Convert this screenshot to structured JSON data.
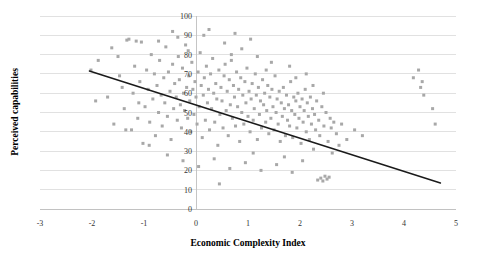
{
  "chart_data": {
    "type": "scatter",
    "title": "",
    "xlabel": "Economic Complexity Index",
    "ylabel": "Perceived capabilities",
    "xlim": [
      -3,
      5
    ],
    "ylim": [
      0,
      100
    ],
    "xticks": [
      "-3",
      "-2",
      "-1",
      "0",
      "1",
      "2",
      "3",
      "4",
      "5"
    ],
    "xtick_values": [
      -3,
      -2,
      -1,
      0,
      1,
      2,
      3,
      4,
      5
    ],
    "yticks": [
      "0",
      "10",
      "20",
      "30",
      "40",
      "50",
      "60",
      "70",
      "80",
      "90",
      "100"
    ],
    "ytick_values": [
      0,
      10,
      20,
      30,
      40,
      50,
      60,
      70,
      80,
      90,
      100
    ],
    "grid": "horizontal",
    "legend": "none",
    "marker": "square",
    "marker_color": "#a8a8a8",
    "marker_size_px": 3,
    "trendline": {
      "type": "linear",
      "color": "#1a1a1a",
      "x_start": -2.05,
      "y_start": 71.5,
      "x_end": 4.7,
      "y_end": 13.5
    },
    "points": [
      [
        -2.02,
        72.0
      ],
      [
        -1.93,
        56.0
      ],
      [
        -1.62,
        83.5
      ],
      [
        -1.58,
        44.0
      ],
      [
        -1.47,
        69.0
      ],
      [
        -1.42,
        63.0
      ],
      [
        -1.38,
        52.0
      ],
      [
        -1.33,
        87.5
      ],
      [
        -1.29,
        88.0
      ],
      [
        -1.24,
        41.0
      ],
      [
        -1.21,
        60.0
      ],
      [
        -1.18,
        74.0
      ],
      [
        -1.15,
        87.0
      ],
      [
        -1.12,
        47.0
      ],
      [
        -1.08,
        66.0
      ],
      [
        -1.05,
        86.5
      ],
      [
        -1.02,
        34.0
      ],
      [
        -0.98,
        53.0
      ],
      [
        -0.95,
        72.0
      ],
      [
        -0.92,
        62.0
      ],
      [
        -0.89,
        45.0
      ],
      [
        -0.86,
        80.0
      ],
      [
        -0.83,
        57.0
      ],
      [
        -0.8,
        70.0
      ],
      [
        -0.78,
        38.0
      ],
      [
        -0.75,
        64.0
      ],
      [
        -0.72,
        50.0
      ],
      [
        -0.7,
        77.0
      ],
      [
        -0.67,
        59.0
      ],
      [
        -0.65,
        43.0
      ],
      [
        -0.62,
        68.0
      ],
      [
        -0.6,
        55.0
      ],
      [
        -0.58,
        84.0
      ],
      [
        -0.55,
        48.0
      ],
      [
        -0.53,
        71.0
      ],
      [
        -0.5,
        61.0
      ],
      [
        -0.48,
        36.0
      ],
      [
        -0.45,
        75.0
      ],
      [
        -0.43,
        52.0
      ],
      [
        -0.41,
        65.0
      ],
      [
        -0.38,
        58.0
      ],
      [
        -0.36,
        46.0
      ],
      [
        -0.34,
        79.0
      ],
      [
        -0.32,
        67.0
      ],
      [
        -0.3,
        54.0
      ],
      [
        -0.28,
        42.0
      ],
      [
        -0.26,
        73.0
      ],
      [
        -0.24,
        60.0
      ],
      [
        -0.22,
        51.0
      ],
      [
        -0.2,
        85.0
      ],
      [
        -0.18,
        63.0
      ],
      [
        -0.16,
        47.0
      ],
      [
        -0.14,
        69.0
      ],
      [
        -0.12,
        56.0
      ],
      [
        -0.1,
        40.0
      ],
      [
        -0.08,
        76.0
      ],
      [
        -0.06,
        62.0
      ],
      [
        -0.04,
        49.0
      ],
      [
        -0.02,
        66.0
      ],
      [
        0.0,
        58.0
      ],
      [
        0.02,
        44.0
      ],
      [
        0.04,
        71.0
      ],
      [
        0.06,
        53.0
      ],
      [
        0.08,
        81.0
      ],
      [
        0.1,
        64.0
      ],
      [
        0.12,
        37.0
      ],
      [
        0.14,
        59.0
      ],
      [
        0.16,
        68.0
      ],
      [
        0.18,
        46.0
      ],
      [
        0.2,
        74.0
      ],
      [
        0.22,
        55.0
      ],
      [
        0.24,
        62.0
      ],
      [
        0.26,
        41.0
      ],
      [
        0.28,
        70.0
      ],
      [
        0.3,
        52.0
      ],
      [
        0.32,
        78.0
      ],
      [
        0.34,
        60.0
      ],
      [
        0.36,
        45.0
      ],
      [
        0.38,
        65.0
      ],
      [
        0.4,
        57.0
      ],
      [
        0.42,
        33.0
      ],
      [
        0.44,
        72.0
      ],
      [
        0.46,
        49.0
      ],
      [
        0.48,
        63.0
      ],
      [
        0.5,
        56.0
      ],
      [
        0.52,
        42.0
      ],
      [
        0.54,
        69.0
      ],
      [
        0.56,
        75.0
      ],
      [
        0.58,
        51.0
      ],
      [
        0.6,
        61.0
      ],
      [
        0.62,
        38.0
      ],
      [
        0.64,
        67.0
      ],
      [
        0.66,
        54.0
      ],
      [
        0.68,
        80.0
      ],
      [
        0.7,
        47.0
      ],
      [
        0.72,
        64.0
      ],
      [
        0.74,
        58.0
      ],
      [
        0.76,
        43.0
      ],
      [
        0.78,
        71.0
      ],
      [
        0.8,
        53.0
      ],
      [
        0.82,
        62.0
      ],
      [
        0.84,
        35.0
      ],
      [
        0.86,
        68.0
      ],
      [
        0.88,
        50.0
      ],
      [
        0.9,
        59.0
      ],
      [
        0.92,
        44.0
      ],
      [
        0.94,
        66.0
      ],
      [
        0.96,
        55.0
      ],
      [
        0.98,
        73.0
      ],
      [
        1.0,
        48.0
      ],
      [
        1.02,
        61.0
      ],
      [
        1.04,
        40.0
      ],
      [
        1.06,
        57.0
      ],
      [
        1.08,
        65.0
      ],
      [
        1.1,
        46.0
      ],
      [
        1.12,
        52.0
      ],
      [
        1.14,
        70.0
      ],
      [
        1.16,
        59.0
      ],
      [
        1.18,
        36.0
      ],
      [
        1.2,
        63.0
      ],
      [
        1.22,
        49.0
      ],
      [
        1.24,
        56.0
      ],
      [
        1.26,
        42.0
      ],
      [
        1.28,
        67.0
      ],
      [
        1.3,
        54.0
      ],
      [
        1.32,
        60.0
      ],
      [
        1.34,
        45.0
      ],
      [
        1.36,
        51.0
      ],
      [
        1.38,
        64.0
      ],
      [
        1.4,
        39.0
      ],
      [
        1.42,
        58.0
      ],
      [
        1.44,
        47.0
      ],
      [
        1.46,
        62.0
      ],
      [
        1.48,
        53.0
      ],
      [
        1.5,
        41.0
      ],
      [
        1.52,
        69.0
      ],
      [
        1.54,
        50.0
      ],
      [
        1.56,
        57.0
      ],
      [
        1.58,
        44.0
      ],
      [
        1.6,
        61.0
      ],
      [
        1.62,
        35.0
      ],
      [
        1.64,
        55.0
      ],
      [
        1.66,
        48.0
      ],
      [
        1.68,
        63.0
      ],
      [
        1.7,
        52.0
      ],
      [
        1.72,
        38.0
      ],
      [
        1.74,
        59.0
      ],
      [
        1.76,
        46.0
      ],
      [
        1.78,
        54.0
      ],
      [
        1.8,
        43.0
      ],
      [
        1.82,
        66.0
      ],
      [
        1.84,
        51.0
      ],
      [
        1.86,
        37.0
      ],
      [
        1.88,
        58.0
      ],
      [
        1.9,
        49.0
      ],
      [
        1.92,
        56.0
      ],
      [
        1.94,
        42.0
      ],
      [
        1.96,
        60.0
      ],
      [
        1.98,
        47.0
      ],
      [
        2.0,
        53.0
      ],
      [
        2.02,
        34.0
      ],
      [
        2.04,
        57.0
      ],
      [
        2.06,
        45.0
      ],
      [
        2.08,
        51.0
      ],
      [
        2.1,
        62.0
      ],
      [
        2.12,
        40.0
      ],
      [
        2.14,
        55.0
      ],
      [
        2.16,
        48.0
      ],
      [
        2.18,
        36.0
      ],
      [
        2.2,
        58.0
      ],
      [
        2.22,
        44.0
      ],
      [
        2.24,
        52.0
      ],
      [
        2.26,
        31.0
      ],
      [
        2.28,
        49.0
      ],
      [
        2.3,
        41.0
      ],
      [
        2.32,
        56.0
      ],
      [
        2.34,
        15.0
      ],
      [
        2.36,
        46.0
      ],
      [
        2.38,
        38.0
      ],
      [
        2.4,
        16.0
      ],
      [
        2.42,
        53.0
      ],
      [
        2.44,
        14.5
      ],
      [
        2.46,
        43.0
      ],
      [
        2.48,
        17.0
      ],
      [
        2.5,
        50.0
      ],
      [
        2.52,
        15.5
      ],
      [
        2.54,
        35.0
      ],
      [
        2.56,
        16.5
      ],
      [
        2.58,
        47.0
      ],
      [
        2.6,
        42.0
      ],
      [
        2.62,
        29.0
      ],
      [
        2.65,
        45.0
      ],
      [
        2.7,
        39.0
      ],
      [
        2.75,
        33.0
      ],
      [
        2.8,
        44.0
      ],
      [
        2.9,
        36.0
      ],
      [
        -1.7,
        58.0
      ],
      [
        -1.35,
        41.0
      ],
      [
        -0.9,
        33.0
      ],
      [
        -0.55,
        28.0
      ],
      [
        -0.25,
        25.0
      ],
      [
        0.05,
        22.0
      ],
      [
        0.35,
        26.0
      ],
      [
        0.65,
        21.0
      ],
      [
        0.95,
        24.0
      ],
      [
        1.25,
        20.0
      ],
      [
        1.55,
        23.0
      ],
      [
        1.85,
        19.0
      ],
      [
        0.45,
        13.0
      ],
      [
        1.1,
        29.0
      ],
      [
        1.7,
        27.0
      ],
      [
        2.05,
        25.0
      ],
      [
        4.18,
        68.0
      ],
      [
        4.28,
        72.0
      ],
      [
        4.32,
        63.0
      ],
      [
        4.35,
        66.0
      ],
      [
        4.38,
        59.0
      ],
      [
        4.55,
        52.0
      ],
      [
        4.6,
        44.0
      ],
      [
        -1.88,
        77.0
      ],
      [
        -1.5,
        79.0
      ],
      [
        -1.1,
        55.0
      ],
      [
        -0.72,
        87.0
      ],
      [
        -0.35,
        89.0
      ],
      [
        0.15,
        90.0
      ],
      [
        0.55,
        86.0
      ],
      [
        0.88,
        83.0
      ],
      [
        1.18,
        79.0
      ],
      [
        1.45,
        76.0
      ],
      [
        1.8,
        74.0
      ],
      [
        2.12,
        70.0
      ],
      [
        0.25,
        93.0
      ],
      [
        0.75,
        91.0
      ],
      [
        1.05,
        88.0
      ],
      [
        -0.45,
        92.0
      ],
      [
        -0.15,
        82.0
      ],
      [
        0.68,
        77.0
      ],
      [
        1.35,
        72.0
      ],
      [
        1.92,
        68.0
      ],
      [
        2.25,
        64.0
      ],
      [
        2.45,
        60.0
      ],
      [
        3.05,
        41.0
      ],
      [
        3.2,
        38.0
      ]
    ]
  }
}
